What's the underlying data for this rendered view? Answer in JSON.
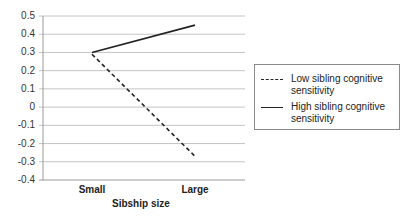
{
  "chart_data": {
    "type": "line",
    "title": "",
    "xlabel": "Sibship size",
    "ylabel": "",
    "categories": [
      "Small",
      "Large"
    ],
    "series": [
      {
        "name": "Low sibling cognitive sensitivity",
        "style": "dashed",
        "color": "#222222",
        "values": [
          0.29,
          -0.27
        ]
      },
      {
        "name": "High sibling cognitive sensitivity",
        "style": "solid",
        "color": "#222222",
        "values": [
          0.3,
          0.45
        ]
      }
    ],
    "ylim": [
      -0.4,
      0.5
    ],
    "yticks": [
      "0.5",
      "0.4",
      "0.3",
      "0.2",
      "0.1",
      "0",
      "-0.1",
      "-0.2",
      "-0.3",
      "-0.4"
    ],
    "grid": true,
    "legend_position": "right"
  },
  "legend": {
    "items": [
      {
        "label_line1": "Low sibling cognitive",
        "label_line2": "sensitivity"
      },
      {
        "label_line1": "High sibling cognitive",
        "label_line2": "sensitivity"
      }
    ]
  }
}
